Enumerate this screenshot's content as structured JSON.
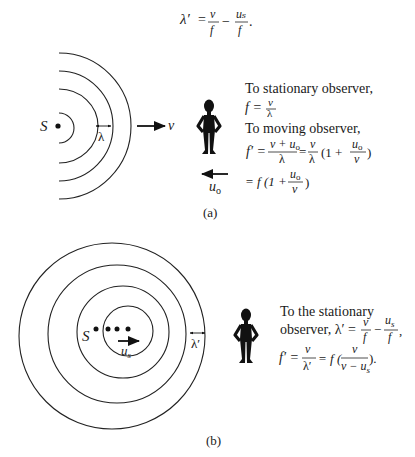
{
  "top_equation": {
    "lhs": "λ′",
    "eq": "=",
    "t1_num": "v",
    "t1_den": "f",
    "minus": "−",
    "t2_num": "uₛ",
    "t2_den": "f",
    "period": "."
  },
  "part_a": {
    "source_label": "S",
    "wavelength_label": "λ",
    "wave_velocity_label": "v",
    "observer_velocity_label": "u",
    "observer_velocity_sub": "o",
    "caption": "(a)",
    "text": {
      "line1": "To stationary observer,",
      "line2_lhs": "f =",
      "line2_num": "v",
      "line2_den": "λ",
      "line3": "To moving observer,",
      "line4_lhs": "f′ =",
      "line4_frac1_num": "v + u",
      "line4_frac1_num_sub": "o",
      "line4_frac1_den": "λ",
      "line4_eq": "=",
      "line4_frac2_num": "v",
      "line4_frac2_den": "λ",
      "line4_paren_open": "(1 +",
      "line4_frac3_num": "u",
      "line4_frac3_num_sub": "o",
      "line4_frac3_den": "v",
      "line4_paren_close": ")",
      "line5_lhs": "= f (1 +",
      "line5_frac_num": "u",
      "line5_frac_num_sub": "o",
      "line5_frac_den": "v",
      "line5_close": ")"
    }
  },
  "part_b": {
    "source_label": "S",
    "source_velocity_label": "u",
    "source_velocity_sub": "s",
    "wavelength_label": "λ′",
    "caption": "(b)",
    "text": {
      "line1": "To the stationary",
      "line2_prefix": "observer, λ′ =",
      "line2_frac1_num": "v",
      "line2_frac1_den": "f",
      "line2_minus": "−",
      "line2_frac2_num": "u",
      "line2_frac2_num_sub": "s",
      "line2_frac2_den": "f",
      "line2_comma": ",",
      "line3_lhs": "f′ =",
      "line3_frac1_num": "v",
      "line3_frac1_den": "λ′",
      "line3_eq": "= f (",
      "line3_frac2_num": "v",
      "line3_frac2_den": "v − u",
      "line3_frac2_den_sub": "s",
      "line3_close": ")."
    }
  }
}
